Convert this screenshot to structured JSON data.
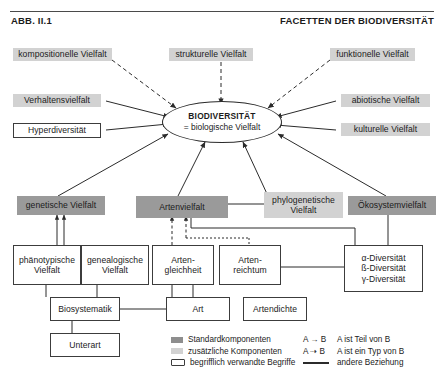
{
  "header": {
    "figure_label": "ABB. II.1",
    "title": "FACETTEN DER BIODIVERSITÄT"
  },
  "center": {
    "line1": "BIODIVERSITÄT",
    "line2": "= biologische Vielfalt"
  },
  "nodes": {
    "kompositionelle": "kompositionelle Vielfalt",
    "strukturelle": "strukturelle Vielfalt",
    "funktionelle": "funktionelle Vielfalt",
    "verhaltens": "Verhaltensvielfalt",
    "hyper": "Hyperdiversität",
    "abiotische": "abiotische Vielfalt",
    "kulturelle": "kulturelle Vielfalt",
    "genetische": "genetische Vielfalt",
    "arten": "Artenvielfalt",
    "phylogenetische": "phylogenetische Vielfalt",
    "oekosystem": "Ökosystemvielfalt",
    "phaenotypische": "phänotypische Vielfalt",
    "genealogische": "genealogische Vielfalt",
    "artengleichheit": "Arten-gleichheit",
    "artenreichtum": "Arten-reichtum",
    "diversitaeten_a": "α-Diversität",
    "diversitaeten_b": "ß-Diversität",
    "diversitaeten_g": "γ-Diversität",
    "biosystematik": "Biosystematik",
    "art": "Art",
    "artendichte": "Artendichte",
    "unterart": "Unterart"
  },
  "legend": {
    "swatches": [
      {
        "label": "Standardkomponenten",
        "kind": "std"
      },
      {
        "label": "zusätzliche Komponenten",
        "kind": "add"
      },
      {
        "label": "begrifflich verwandte Begriffe",
        "kind": "rel"
      }
    ],
    "relations": [
      {
        "key": "A → B",
        "label": "A ist Teil von B"
      },
      {
        "key": "A ⇢ B",
        "label": "A ist ein Typ von B"
      },
      {
        "key": "",
        "label": "andere Beziehung"
      }
    ]
  },
  "colors": {
    "standard_component": "#9a9a9a",
    "additional_component": "#d2d2d2",
    "related_term": "#ffffff",
    "stroke": "#2b2b2b",
    "text": "#1b1b1b"
  }
}
